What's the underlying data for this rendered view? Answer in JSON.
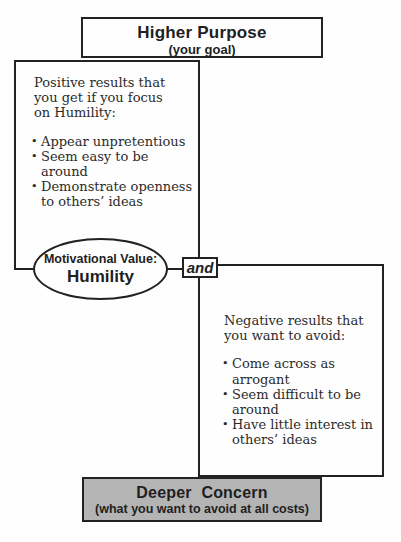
{
  "colors": {
    "line": "#222222",
    "gray_fill": "#b4b4b4",
    "background": "#fefefe"
  },
  "higher_purpose": {
    "title": "Higher Purpose",
    "subtitle": "(your goal)"
  },
  "positive_box": {
    "intro": "Positive results that\nyou get if you focus\non Humility:",
    "bullet_char": "•",
    "bullets": [
      {
        "text": "Appear unpretentious"
      },
      {
        "text": "Seem easy to be around"
      },
      {
        "text": "Demonstrate openness\nto others’ ideas"
      }
    ]
  },
  "value_ellipse": {
    "label": "Motivational Value:",
    "value": "Humility"
  },
  "and_connector": {
    "label": "and"
  },
  "negative_box": {
    "intro": "Negative results that\nyou want to avoid:",
    "bullet_char": "•",
    "bullets": [
      {
        "text": "Come across as arrogant"
      },
      {
        "text": "Seem difficult to be\naround"
      },
      {
        "text": "Have little interest in\nothers’ ideas"
      }
    ]
  },
  "deeper_concern": {
    "title": "Deeper Concern",
    "subtitle": "(what you want to avoid at all costs)"
  }
}
